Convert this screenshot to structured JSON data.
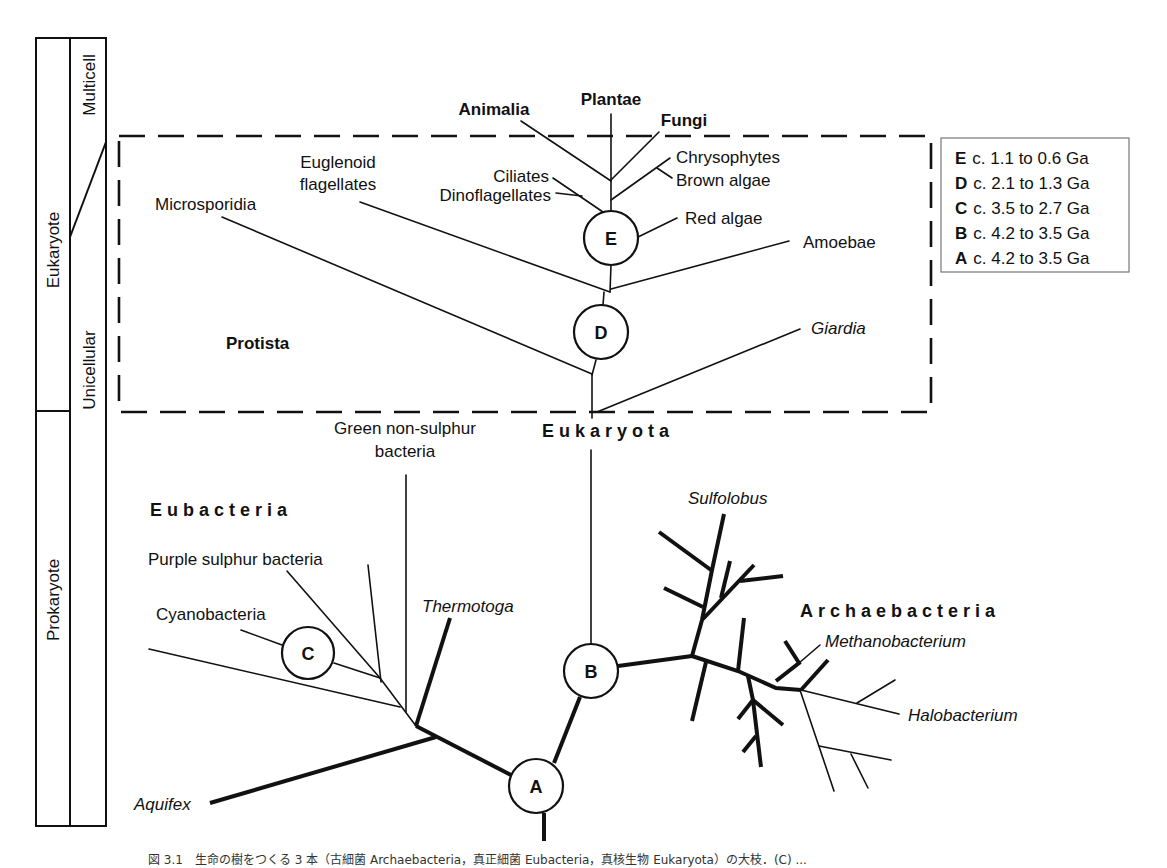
{
  "timescale": {
    "col1": {
      "upper": "Eukaryote",
      "lower": "Prokaryote"
    },
    "col2": {
      "upper": "Multicell",
      "lower": "Unicellular"
    }
  },
  "groups": {
    "protista": "Protista",
    "eukaryota": "Eukaryota",
    "eubacteria": "Eubacteria",
    "archaebacteria": "Archaebacteria"
  },
  "taxa": {
    "animalia": "Animalia",
    "plantae": "Plantae",
    "fungi": "Fungi",
    "chrysophytes": "Chrysophytes",
    "brown_algae": "Brown algae",
    "ciliates": "Ciliates",
    "dinoflagellates": "Dinoflagellates",
    "euglenoid_1": "Euglenoid",
    "euglenoid_2": "flagellates",
    "microsporidia": "Microsporidia",
    "red_algae": "Red algae",
    "amoebae": "Amoebae",
    "giardia": "Giardia",
    "green_1": "Green non-sulphur",
    "green_2": "bacteria",
    "purple": "Purple sulphur bacteria",
    "cyanobacteria": "Cyanobacteria",
    "thermotoga": "Thermotoga",
    "aquifex": "Aquifex",
    "sulfolobus": "Sulfolobus",
    "methanobacterium": "Methanobacterium",
    "halobacterium": "Halobacterium"
  },
  "nodes": {
    "A": "A",
    "B": "B",
    "C": "C",
    "D": "D",
    "E": "E"
  },
  "legend": [
    {
      "key": "E",
      "text": "c. 1.1 to 0.6 Ga"
    },
    {
      "key": "D",
      "text": "c. 2.1 to 1.3 Ga"
    },
    {
      "key": "C",
      "text": "c. 3.5 to 2.7 Ga"
    },
    {
      "key": "B",
      "text": "c. 4.2 to 3.5 Ga"
    },
    {
      "key": "A",
      "text": "c. 4.2 to 3.5 Ga"
    }
  ],
  "caption": "図 3.1　生命の樹をつくる 3 本（古細菌 Archaebacteria，真正細菌 Eubacteria，真核生物 Eukaryota）の大枝．(C) ..."
}
